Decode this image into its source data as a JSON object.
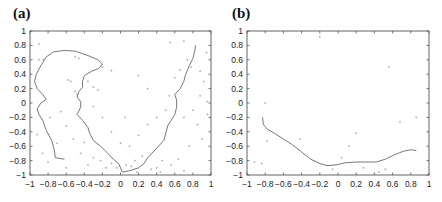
{
  "chart_data": [
    {
      "panel_label": "(a)",
      "type": "scatter",
      "title": "",
      "xlabel": "",
      "ylabel": "",
      "xlim": [
        -1,
        1
      ],
      "ylim": [
        -1,
        1
      ],
      "xticks": [
        "-1",
        "-0.8",
        "-0.6",
        "-0.4",
        "-0.2",
        "0",
        "0.2",
        "0.4",
        "0.6",
        "0.8",
        "1"
      ],
      "yticks": [
        "1",
        "0.8",
        "0.6",
        "0.4",
        "0.2",
        "0",
        "-0.2",
        "-0.4",
        "-0.6",
        "-0.8",
        "-1"
      ],
      "grid": false,
      "series": [
        {
          "name": "curve",
          "kind": "line",
          "points": [
            [
              -0.62,
              -0.78
            ],
            [
              -0.72,
              -0.76
            ],
            [
              -0.73,
              -0.66
            ],
            [
              -0.76,
              -0.52
            ],
            [
              -0.82,
              -0.38
            ],
            [
              -0.86,
              -0.24
            ],
            [
              -0.9,
              -0.16
            ],
            [
              -0.92,
              -0.08
            ],
            [
              -0.88,
              0.0
            ],
            [
              -0.82,
              0.05
            ],
            [
              -0.86,
              0.12
            ],
            [
              -0.92,
              0.2
            ],
            [
              -0.95,
              0.3
            ],
            [
              -0.93,
              0.4
            ],
            [
              -0.88,
              0.52
            ],
            [
              -0.82,
              0.64
            ],
            [
              -0.74,
              0.71
            ],
            [
              -0.62,
              0.73
            ],
            [
              -0.5,
              0.72
            ],
            [
              -0.36,
              0.66
            ],
            [
              -0.25,
              0.6
            ],
            [
              -0.2,
              0.54
            ],
            [
              -0.24,
              0.48
            ],
            [
              -0.32,
              0.44
            ],
            [
              -0.4,
              0.38
            ],
            [
              -0.42,
              0.3
            ],
            [
              -0.42,
              0.22
            ],
            [
              -0.46,
              0.16
            ],
            [
              -0.48,
              0.08
            ],
            [
              -0.44,
              0.02
            ],
            [
              -0.44,
              -0.06
            ],
            [
              -0.48,
              -0.16
            ],
            [
              -0.42,
              -0.24
            ],
            [
              -0.36,
              -0.34
            ],
            [
              -0.34,
              -0.42
            ],
            [
              -0.3,
              -0.52
            ],
            [
              -0.22,
              -0.6
            ],
            [
              -0.14,
              -0.7
            ],
            [
              -0.08,
              -0.78
            ],
            [
              -0.02,
              -0.84
            ],
            [
              0.0,
              -0.9
            ],
            [
              0.02,
              -0.96
            ],
            [
              0.1,
              -0.94
            ],
            [
              0.2,
              -0.9
            ],
            [
              0.26,
              -0.84
            ],
            [
              0.3,
              -0.76
            ],
            [
              0.36,
              -0.68
            ],
            [
              0.42,
              -0.6
            ],
            [
              0.48,
              -0.52
            ],
            [
              0.5,
              -0.42
            ],
            [
              0.52,
              -0.32
            ],
            [
              0.56,
              -0.24
            ],
            [
              0.6,
              -0.16
            ],
            [
              0.62,
              -0.06
            ],
            [
              0.62,
              0.04
            ],
            [
              0.6,
              0.12
            ],
            [
              0.66,
              0.2
            ],
            [
              0.7,
              0.3
            ],
            [
              0.72,
              0.4
            ],
            [
              0.76,
              0.52
            ],
            [
              0.8,
              0.62
            ],
            [
              0.82,
              0.72
            ],
            [
              0.83,
              0.8
            ]
          ]
        },
        {
          "name": "samples",
          "kind": "points",
          "points": [
            [
              -0.9,
              0.82
            ],
            [
              -0.85,
              0.6
            ],
            [
              -0.5,
              0.64
            ],
            [
              -0.46,
              0.62
            ],
            [
              -0.55,
              0.3
            ],
            [
              -0.5,
              0.16
            ],
            [
              -0.48,
              0.12
            ],
            [
              -0.36,
              0.3
            ],
            [
              -0.3,
              0.22
            ],
            [
              -0.25,
              0.18
            ],
            [
              -0.58,
              0.32
            ],
            [
              -0.9,
              0.6
            ],
            [
              -0.2,
              0.5
            ],
            [
              -0.1,
              0.45
            ],
            [
              0.2,
              0.38
            ],
            [
              0.3,
              0.2
            ],
            [
              0.55,
              0.84
            ],
            [
              0.7,
              0.86
            ],
            [
              0.78,
              0.5
            ],
            [
              0.88,
              0.44
            ],
            [
              0.92,
              0.3
            ],
            [
              0.88,
              0.1
            ],
            [
              0.74,
              0.6
            ],
            [
              0.66,
              0.46
            ],
            [
              0.95,
              0.7
            ],
            [
              0.6,
              0.35
            ],
            [
              0.54,
              0.1
            ],
            [
              0.5,
              -0.1
            ],
            [
              0.7,
              -0.2
            ],
            [
              0.85,
              -0.3
            ],
            [
              0.9,
              -0.5
            ],
            [
              0.76,
              -0.6
            ],
            [
              0.64,
              -0.78
            ],
            [
              0.56,
              -0.86
            ],
            [
              0.46,
              -0.8
            ],
            [
              0.4,
              -0.9
            ],
            [
              0.34,
              -0.92
            ],
            [
              0.24,
              -0.74
            ],
            [
              0.16,
              -0.8
            ],
            [
              0.12,
              -0.88
            ],
            [
              0.06,
              -0.86
            ],
            [
              -0.04,
              -0.9
            ],
            [
              -0.1,
              -0.84
            ],
            [
              -0.16,
              -0.9
            ],
            [
              -0.22,
              -0.8
            ],
            [
              -0.3,
              -0.76
            ],
            [
              -0.36,
              -0.86
            ],
            [
              -0.44,
              -0.7
            ],
            [
              -0.52,
              -0.5
            ],
            [
              -0.6,
              -0.32
            ],
            [
              -0.66,
              -0.12
            ],
            [
              -0.7,
              -0.56
            ],
            [
              -0.8,
              -0.82
            ],
            [
              -0.86,
              -0.7
            ],
            [
              -0.92,
              -0.44
            ],
            [
              -0.78,
              -0.2
            ],
            [
              -0.2,
              -0.2
            ],
            [
              -0.1,
              -0.4
            ],
            [
              0.0,
              -0.56
            ],
            [
              0.1,
              -0.6
            ],
            [
              0.2,
              -0.45
            ],
            [
              0.3,
              -0.3
            ],
            [
              0.4,
              -0.2
            ],
            [
              -0.3,
              -0.05
            ],
            [
              0.05,
              -0.2
            ],
            [
              -0.6,
              -0.9
            ],
            [
              -0.4,
              -0.55
            ],
            [
              0.18,
              -0.96
            ],
            [
              0.44,
              -0.96
            ],
            [
              0.7,
              -0.94
            ],
            [
              0.8,
              -0.1
            ],
            [
              0.96,
              0.02
            ],
            [
              0.96,
              -0.16
            ]
          ]
        }
      ]
    },
    {
      "panel_label": "(b)",
      "type": "scatter",
      "title": "",
      "xlabel": "",
      "ylabel": "",
      "xlim": [
        -1,
        1
      ],
      "ylim": [
        -1,
        1
      ],
      "xticks": [
        "-1",
        "-0.8",
        "-0.6",
        "-0.4",
        "-0.2",
        "0",
        "0.2",
        "0.4",
        "0.6",
        "0.8",
        "1"
      ],
      "yticks": [
        "1",
        "0.8",
        "0.6",
        "0.4",
        "0.2",
        "0",
        "-0.2",
        "-0.4",
        "-0.6",
        "-0.8",
        "-1"
      ],
      "grid": false,
      "series": [
        {
          "name": "curve",
          "kind": "line",
          "points": [
            [
              -0.83,
              -0.2
            ],
            [
              -0.82,
              -0.3
            ],
            [
              -0.78,
              -0.36
            ],
            [
              -0.7,
              -0.42
            ],
            [
              -0.6,
              -0.5
            ],
            [
              -0.5,
              -0.58
            ],
            [
              -0.4,
              -0.68
            ],
            [
              -0.3,
              -0.78
            ],
            [
              -0.2,
              -0.84
            ],
            [
              -0.12,
              -0.87
            ],
            [
              -0.02,
              -0.86
            ],
            [
              0.08,
              -0.83
            ],
            [
              0.2,
              -0.82
            ],
            [
              0.3,
              -0.82
            ],
            [
              0.42,
              -0.82
            ],
            [
              0.52,
              -0.78
            ],
            [
              0.62,
              -0.72
            ],
            [
              0.72,
              -0.67
            ],
            [
              0.8,
              -0.65
            ],
            [
              0.86,
              -0.66
            ]
          ]
        },
        {
          "name": "samples",
          "kind": "points",
          "points": [
            [
              -0.8,
              0.0
            ],
            [
              -0.2,
              0.92
            ],
            [
              -0.42,
              -0.5
            ],
            [
              -0.78,
              -0.53
            ],
            [
              -0.92,
              -0.82
            ],
            [
              -0.84,
              -0.84
            ],
            [
              0.12,
              -0.6
            ],
            [
              0.2,
              -0.42
            ],
            [
              0.45,
              -0.96
            ],
            [
              0.4,
              -0.98
            ],
            [
              0.52,
              -0.92
            ],
            [
              0.86,
              -0.2
            ],
            [
              0.68,
              -0.26
            ],
            [
              0.56,
              0.5
            ],
            [
              0.04,
              -0.76
            ],
            [
              -0.06,
              -0.92
            ],
            [
              0.28,
              -0.9
            ]
          ]
        }
      ]
    }
  ]
}
